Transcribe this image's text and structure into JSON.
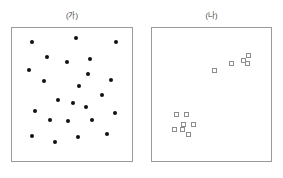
{
  "figure": {
    "background_color": "#ffffff",
    "panel_border_color": "#9a9a9a",
    "caption_color": "#3a3a3a"
  },
  "panels": [
    {
      "id": "panel-ga",
      "caption": "(가)",
      "marker_shape": "filled-circle",
      "marker_color": "#111111",
      "box": {
        "left": 11,
        "top": 27,
        "width": 122,
        "height": 135
      },
      "caption_box": {
        "left": 11,
        "top": 11,
        "width": 122
      }
    },
    {
      "id": "panel-na",
      "caption": "(나)",
      "marker_shape": "open-square",
      "marker_color": "#8d8d8d",
      "box": {
        "left": 151,
        "top": 27,
        "width": 121,
        "height": 135
      },
      "caption_box": {
        "left": 151,
        "top": 11,
        "width": 121
      }
    }
  ],
  "chart_data": [
    {
      "type": "scatter",
      "title": "(가)",
      "xlabel": "",
      "ylabel": "",
      "xlim": [
        0,
        100
      ],
      "ylim": [
        0,
        100
      ],
      "grid": false,
      "legend": "none",
      "annotation": "randomly dispersed distribution",
      "series": [
        {
          "name": "dispersed points",
          "marker": "filled-circle",
          "color": "#111111",
          "count": 24,
          "points": [
            [
              11,
              96
            ],
            [
              54,
              99
            ],
            [
              93,
              96
            ],
            [
              25,
              83
            ],
            [
              68,
              81
            ],
            [
              8,
              71
            ],
            [
              45,
              78
            ],
            [
              66,
              68
            ],
            [
              23,
              62
            ],
            [
              88,
              63
            ],
            [
              57,
              57
            ],
            [
              79,
              50
            ],
            [
              36,
              45
            ],
            [
              14,
              36
            ],
            [
              92,
              34
            ],
            [
              51,
              43
            ],
            [
              64,
              39
            ],
            [
              28,
              28
            ],
            [
              46,
              27
            ],
            [
              70,
              28
            ],
            [
              11,
              14
            ],
            [
              33,
              9
            ],
            [
              56,
              13
            ],
            [
              84,
              16
            ]
          ]
        }
      ]
    },
    {
      "type": "scatter",
      "title": "(나)",
      "xlabel": "",
      "ylabel": "",
      "xlim": [
        0,
        100
      ],
      "ylim": [
        0,
        100
      ],
      "grid": false,
      "legend": "none",
      "annotation": "clustered distribution in two groups",
      "series": [
        {
          "name": "cluster upper-right",
          "marker": "open-square",
          "color": "#8d8d8d",
          "count": 5,
          "points": [
            [
              53,
              71
            ],
            [
              70,
              77
            ],
            [
              82,
              80
            ],
            [
              87,
              84
            ],
            [
              86,
              77
            ]
          ]
        },
        {
          "name": "cluster lower-left",
          "marker": "open-square",
          "color": "#8d8d8d",
          "count": 7,
          "points": [
            [
              25,
              33
            ],
            [
              22,
              24
            ],
            [
              32,
              24
            ],
            [
              13,
              20
            ],
            [
              21,
              20
            ],
            [
              27,
              15
            ],
            [
              15,
              33
            ]
          ]
        }
      ]
    }
  ]
}
